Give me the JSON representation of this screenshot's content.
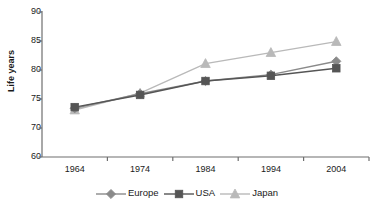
{
  "chart_data": {
    "type": "line",
    "title": "",
    "xlabel": "",
    "ylabel": "Life years",
    "categories": [
      "1964",
      "1974",
      "1984",
      "1994",
      "2004"
    ],
    "x": [
      1964,
      1974,
      1984,
      1994,
      2004
    ],
    "ytick_labels": [
      "90",
      "85",
      "80",
      "75",
      "70",
      "60"
    ],
    "ytick_positions": [
      90,
      85,
      80,
      75,
      70,
      65
    ],
    "ylim": [
      65,
      90
    ],
    "grid": false,
    "legend_position": "bottom",
    "series": [
      {
        "name": "Europe",
        "marker": "diamond",
        "color": "#8a8a8a",
        "values": [
          73.4,
          75.9,
          78.1,
          79.2,
          81.5
        ]
      },
      {
        "name": "USA",
        "marker": "square",
        "color": "#555555",
        "values": [
          73.6,
          75.7,
          78.1,
          79.0,
          80.3
        ]
      },
      {
        "name": "Japan",
        "marker": "triangle",
        "color": "#b9b9b9",
        "values": [
          73.1,
          76.0,
          81.1,
          83.0,
          84.9
        ]
      }
    ]
  },
  "axis": {
    "y_title": "Life years",
    "axis_color": "#6e6e6e"
  },
  "legend": {
    "items": [
      {
        "label": "Europe",
        "marker": "diamond-marker-icon",
        "color": "#8a8a8a"
      },
      {
        "label": "USA",
        "marker": "square-marker-icon",
        "color": "#555555"
      },
      {
        "label": "Japan",
        "marker": "triangle-marker-icon",
        "color": "#b9b9b9"
      }
    ]
  }
}
